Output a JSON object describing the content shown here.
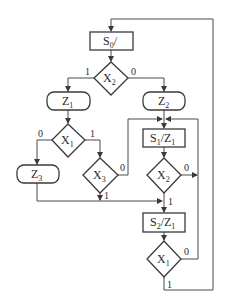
{
  "diagram": {
    "type": "ASM flowchart",
    "nodes": {
      "s0": {
        "kind": "state",
        "name": "S",
        "sub": "0",
        "output": "/"
      },
      "x2_top": {
        "kind": "decision",
        "name": "X",
        "sub": "2"
      },
      "z1_cond": {
        "kind": "conditional-output",
        "name": "Z",
        "sub": "1"
      },
      "z2_cond": {
        "kind": "conditional-output",
        "name": "Z",
        "sub": "2"
      },
      "x1_left": {
        "kind": "decision",
        "name": "X",
        "sub": "1"
      },
      "z3_cond": {
        "kind": "conditional-output",
        "name": "Z",
        "sub": "3"
      },
      "x3": {
        "kind": "decision",
        "name": "X",
        "sub": "3"
      },
      "s1": {
        "kind": "state",
        "name": "S",
        "sub": "1",
        "output": "/Z",
        "output_sub": "1"
      },
      "x2_mid": {
        "kind": "decision",
        "name": "X",
        "sub": "2"
      },
      "s2": {
        "kind": "state",
        "name": "S",
        "sub": "2",
        "output": "/Z",
        "output_sub": "1"
      },
      "x1_bottom": {
        "kind": "decision",
        "name": "X",
        "sub": "1"
      }
    },
    "edge_labels": {
      "x2_top_1": "1",
      "x2_top_0": "0",
      "x1_left_0": "0",
      "x1_left_1": "1",
      "x3_0": "0",
      "x3_1": "1",
      "x2_mid_0": "0",
      "x2_mid_1": "1",
      "x1_bottom_0": "0",
      "x1_bottom_1": "1"
    },
    "edges": [
      {
        "from": "x2_top",
        "label": "1",
        "to": "z1_cond"
      },
      {
        "from": "x2_top",
        "label": "0",
        "to": "z2_cond"
      },
      {
        "from": "z1_cond",
        "to": "x1_left"
      },
      {
        "from": "x1_left",
        "label": "0",
        "to": "z3_cond"
      },
      {
        "from": "x1_left",
        "label": "1",
        "to": "x3"
      },
      {
        "from": "x3",
        "label": "0",
        "to": "s1"
      },
      {
        "from": "x3",
        "label": "1",
        "to": "s2"
      },
      {
        "from": "z3_cond",
        "to": "s2"
      },
      {
        "from": "z2_cond",
        "to": "s1"
      },
      {
        "from": "s1",
        "to": "x2_mid"
      },
      {
        "from": "x2_mid",
        "label": "0",
        "to": "s1"
      },
      {
        "from": "x2_mid",
        "label": "1",
        "to": "s2"
      },
      {
        "from": "s2",
        "to": "x1_bottom"
      },
      {
        "from": "x1_bottom",
        "label": "0",
        "to": "s1"
      },
      {
        "from": "x1_bottom",
        "label": "1",
        "to": "s0"
      }
    ]
  }
}
